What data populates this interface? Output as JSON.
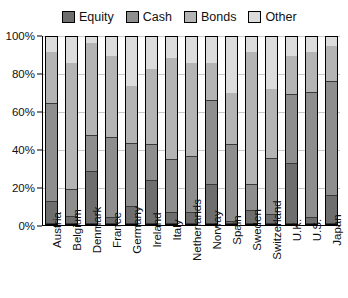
{
  "chart_data": {
    "type": "bar",
    "subtype": "stacked-bar-100",
    "title": "",
    "xlabel": "",
    "ylabel": "",
    "ylim": [
      0,
      100
    ],
    "ytick_labels": [
      "0%",
      "20%",
      "40%",
      "60%",
      "80%",
      "100%"
    ],
    "ytick_values": [
      0,
      20,
      40,
      60,
      80,
      100
    ],
    "grid": true,
    "legend_position": "top",
    "categories": [
      "Austria",
      "Belgium",
      "Denmark",
      "France",
      "Germany",
      "Ireland",
      "Italy",
      "Netherlands",
      "Norway",
      "Spain",
      "Sweden",
      "Switzerland",
      "U.K.",
      "U.S.",
      "Japan"
    ],
    "series": [
      {
        "name": "Equity",
        "color": "#6e6e6e",
        "values": [
          12,
          4,
          28,
          3,
          9,
          23,
          6,
          6,
          21,
          1,
          7,
          5,
          32,
          3,
          15
        ]
      },
      {
        "name": "Cash",
        "color": "#8e8e8e",
        "values": [
          52,
          14,
          19,
          43,
          34,
          19,
          28,
          30,
          45,
          41,
          14,
          30,
          37,
          67,
          61
        ]
      },
      {
        "name": "Bonds",
        "color": "#b4b4b4",
        "values": [
          28,
          68,
          50,
          44,
          31,
          41,
          55,
          50,
          20,
          28,
          71,
          37,
          21,
          22,
          19
        ]
      },
      {
        "name": "Other",
        "color": "#dcdcdc",
        "values": [
          8,
          14,
          3,
          10,
          26,
          17,
          11,
          14,
          14,
          30,
          8,
          28,
          10,
          8,
          5
        ]
      }
    ]
  }
}
